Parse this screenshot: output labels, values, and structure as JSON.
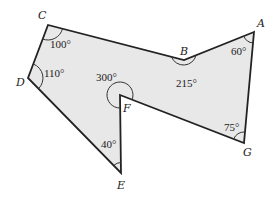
{
  "diagram": {
    "type": "polygon",
    "fill_color": "#e8e8e8",
    "stroke_color": "#222222",
    "vertices": [
      {
        "name": "A",
        "x": 254,
        "y": 32,
        "angle": "60°"
      },
      {
        "name": "B",
        "x": 184,
        "y": 60,
        "angle": "215°"
      },
      {
        "name": "C",
        "x": 48,
        "y": 25,
        "angle": "100°"
      },
      {
        "name": "D",
        "x": 28,
        "y": 78,
        "angle": "110°"
      },
      {
        "name": "E",
        "x": 121,
        "y": 173,
        "angle": "40°"
      },
      {
        "name": "F",
        "x": 120,
        "y": 95,
        "angle": "300°"
      },
      {
        "name": "G",
        "x": 244,
        "y": 143,
        "angle": "75°"
      }
    ]
  },
  "labels": {
    "A": "A",
    "B": "B",
    "C": "C",
    "D": "D",
    "E": "E",
    "F": "F",
    "G": "G"
  },
  "angles": {
    "A": "60°",
    "B": "215°",
    "C": "100°",
    "D": "110°",
    "E": "40°",
    "F": "300°",
    "G": "75°"
  }
}
